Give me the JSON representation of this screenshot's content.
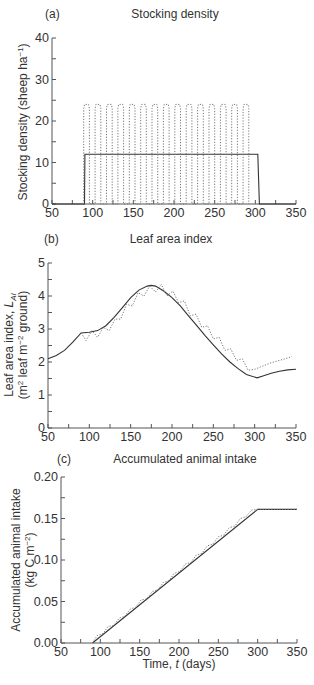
{
  "chart_data": [
    {
      "type": "line",
      "panel": "(a)",
      "title": "Stocking density",
      "xlabel": "",
      "ylabel": "Stocking density (sheep ha⁻¹)",
      "xlim": [
        50,
        350
      ],
      "ylim": [
        0,
        40
      ],
      "xticks": [
        50,
        100,
        150,
        200,
        250,
        300,
        350
      ],
      "yticks": [
        0,
        10,
        20,
        30,
        40
      ],
      "grid": false,
      "series": [
        {
          "name": "continuous grazing",
          "style": "solid",
          "x": [
            50,
            90,
            90.5,
            303,
            305,
            350
          ],
          "y": [
            0,
            0,
            12,
            12,
            0,
            0
          ]
        },
        {
          "name": "rotational grazing",
          "style": "dotted",
          "pulse_height": 24,
          "pulse_starts": [
            89,
            103,
            117,
            131,
            145,
            159,
            173,
            187,
            201,
            215,
            229,
            243,
            257,
            271,
            285
          ],
          "pulse_width": 7
        }
      ]
    },
    {
      "type": "line",
      "panel": "(b)",
      "title": "Leaf area index",
      "xlabel": "",
      "ylabel": "Leaf area index, L_AI (m² leaf m⁻² ground)",
      "xlim": [
        50,
        350
      ],
      "ylim": [
        0,
        5
      ],
      "xticks": [
        50,
        100,
        150,
        200,
        250,
        300,
        350
      ],
      "yticks": [
        0,
        1,
        2,
        3,
        4,
        5
      ],
      "grid": false,
      "series": [
        {
          "name": "continuous grazing",
          "style": "solid",
          "x": [
            50,
            60,
            70,
            80,
            90,
            100,
            110,
            120,
            130,
            140,
            150,
            160,
            170,
            175,
            180,
            190,
            200,
            210,
            220,
            230,
            240,
            250,
            260,
            270,
            280,
            290,
            303,
            310,
            320,
            330,
            340,
            350
          ],
          "y": [
            2.1,
            2.2,
            2.35,
            2.6,
            2.88,
            2.9,
            2.95,
            3.1,
            3.35,
            3.65,
            3.95,
            4.18,
            4.3,
            4.32,
            4.3,
            4.15,
            3.95,
            3.7,
            3.4,
            3.1,
            2.8,
            2.52,
            2.25,
            2.0,
            1.8,
            1.62,
            1.52,
            1.58,
            1.66,
            1.72,
            1.76,
            1.78
          ]
        },
        {
          "name": "rotational grazing",
          "style": "dotted",
          "x": [
            90,
            96,
            103,
            110,
            117,
            124,
            131,
            138,
            145,
            152,
            159,
            166,
            173,
            180,
            187,
            194,
            201,
            208,
            215,
            222,
            229,
            236,
            243,
            250,
            257,
            264,
            271,
            278,
            285,
            292,
            300,
            310,
            320,
            330,
            340,
            345
          ],
          "y": [
            2.88,
            2.65,
            2.95,
            2.75,
            3.05,
            2.95,
            3.3,
            3.3,
            3.75,
            3.7,
            4.1,
            4.0,
            4.3,
            4.12,
            4.35,
            4.0,
            4.15,
            3.8,
            3.85,
            3.4,
            3.45,
            3.05,
            3.1,
            2.7,
            2.75,
            2.35,
            2.4,
            2.05,
            2.1,
            1.75,
            1.78,
            1.88,
            1.98,
            2.05,
            2.12,
            2.17
          ]
        }
      ]
    },
    {
      "type": "line",
      "panel": "(c)",
      "title": "Accumulated animal intake",
      "xlabel": "Time, t (days)",
      "ylabel": "Accumulated animal intake (kg C m⁻²)",
      "xlim": [
        50,
        350
      ],
      "ylim": [
        0,
        0.2
      ],
      "xticks": [
        50,
        100,
        150,
        200,
        250,
        300,
        350
      ],
      "yticks": [
        0.0,
        0.05,
        0.1,
        0.15,
        0.2
      ],
      "grid": false,
      "series": [
        {
          "name": "continuous grazing",
          "style": "solid",
          "x": [
            90,
            300,
            350
          ],
          "y": [
            0.0,
            0.161,
            0.161
          ]
        },
        {
          "name": "rotational grazing",
          "style": "dotted",
          "x": [
            90,
            96,
            103,
            110,
            117,
            124,
            131,
            138,
            145,
            152,
            159,
            166,
            173,
            180,
            187,
            194,
            201,
            208,
            215,
            222,
            229,
            236,
            243,
            250,
            257,
            264,
            271,
            278,
            285,
            292,
            300,
            350
          ],
          "y": [
            0.0,
            0.009,
            0.011,
            0.02,
            0.021,
            0.03,
            0.032,
            0.041,
            0.043,
            0.052,
            0.053,
            0.062,
            0.064,
            0.073,
            0.075,
            0.084,
            0.086,
            0.095,
            0.097,
            0.106,
            0.108,
            0.117,
            0.119,
            0.128,
            0.13,
            0.139,
            0.141,
            0.15,
            0.152,
            0.16,
            0.161,
            0.161
          ]
        }
      ]
    }
  ],
  "panels": {
    "a": {
      "label": "(a)",
      "title": "Stocking density",
      "ylabel": "Stocking density (sheep ha",
      "ylabel_sup": "−1",
      "ylabel_end": ")",
      "yticks": [
        "0",
        "10",
        "20",
        "30",
        "40"
      ],
      "xticks": [
        "50",
        "100",
        "150",
        "200",
        "250",
        "300",
        "350"
      ]
    },
    "b": {
      "label": "(b)",
      "title": "Leaf area index",
      "ylabel1": "Leaf area index, ",
      "ylabel1_sym": "L",
      "ylabel1_sub": "AI",
      "ylabel2a": "(m",
      "ylabel2_sup1": "2",
      "ylabel2b": " leaf m",
      "ylabel2_sup2": "−2",
      "ylabel2c": " ground)",
      "yticks": [
        "0",
        "1",
        "2",
        "3",
        "4",
        "5"
      ],
      "xticks": [
        "50",
        "100",
        "150",
        "200",
        "250",
        "300",
        "350"
      ]
    },
    "c": {
      "label": "(c)",
      "title": "Accumulated animal intake",
      "ylabel1": "Accumulated animal intake",
      "ylabel2a": "(kg C m",
      "ylabel2_sup": "−2",
      "ylabel2b": ")",
      "yticks": [
        "0.00",
        "0.05",
        "0.10",
        "0.15",
        "0.20"
      ],
      "xticks": [
        "50",
        "100",
        "150",
        "200",
        "250",
        "300",
        "350"
      ],
      "xlabel_a": "Time, ",
      "xlabel_t": "t",
      "xlabel_b": " (days)"
    }
  },
  "colors": {
    "axis": "#555555",
    "solid": "#333333",
    "dotted": "#777777"
  }
}
